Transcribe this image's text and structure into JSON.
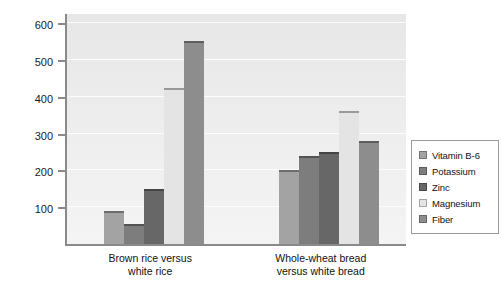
{
  "chart_data": {
    "type": "bar",
    "title": "",
    "xlabel": "",
    "ylabel": "Increase in nutrient content (%)",
    "ylim": [
      0,
      630
    ],
    "yticks": [
      100,
      200,
      300,
      400,
      500,
      600
    ],
    "ytick_labels": [
      "100",
      "200",
      "300",
      "400",
      "500",
      "600"
    ],
    "grid": true,
    "legend_position": "right",
    "categories": [
      "Brown rice versus\nwhite rice",
      "Whole-wheat bread\nversus white bread"
    ],
    "series": [
      {
        "name": "Vitamin B-6",
        "color": "#a3a3a3",
        "values": [
          90,
          200
        ]
      },
      {
        "name": "Potassium",
        "color": "#7d7d7d",
        "values": [
          55,
          240
        ]
      },
      {
        "name": "Zinc",
        "color": "#676767",
        "values": [
          150,
          250
        ]
      },
      {
        "name": "Magnesium",
        "color": "#e4e4e4",
        "values": [
          425,
          360
        ]
      },
      {
        "name": "Fiber",
        "color": "#8d8d8d",
        "values": [
          550,
          280
        ]
      }
    ]
  },
  "legend": {
    "items": [
      {
        "label": "Vitamin B-6"
      },
      {
        "label": "Potassium"
      },
      {
        "label": "Zinc"
      },
      {
        "label": "Magnesium"
      },
      {
        "label": "Fiber"
      }
    ]
  }
}
